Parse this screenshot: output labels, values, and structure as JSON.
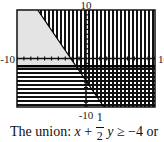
{
  "chart_data": {
    "type": "area",
    "title": "",
    "xlabel": "",
    "ylabel": "",
    "xlim": [
      -10,
      10
    ],
    "ylim": [
      -10,
      10
    ],
    "tick_labels": {
      "top": "10",
      "bottom": "-10",
      "left": "-10",
      "right": "10"
    },
    "x_tick_step": 1,
    "y_tick_step": 1,
    "grid": false,
    "boundaries": [
      {
        "name": "diagonal",
        "equation": "x + (1/2)y = -4",
        "points": [
          [
            -7,
            10
          ],
          [
            2.6,
            -10
          ]
        ],
        "style": "solid"
      },
      {
        "name": "horizontal",
        "equation": "y = -1.6",
        "y": -1.6,
        "style": "thick"
      }
    ],
    "regions": [
      {
        "name": "right-of-diagonal",
        "shading": "vertical-lines",
        "color": "#111111"
      },
      {
        "name": "below-horizontal",
        "shading": "horizontal-lines",
        "color": "#111111"
      },
      {
        "name": "unshaded",
        "shading": "solid",
        "color": "#e4e4e4"
      }
    ]
  },
  "caption": {
    "prefix": "The union: ",
    "var_x": "x",
    "plus": " + ",
    "frac_num": "1",
    "frac_den": "2",
    "var_y": " y",
    "rest": " ≥ −4 or"
  }
}
